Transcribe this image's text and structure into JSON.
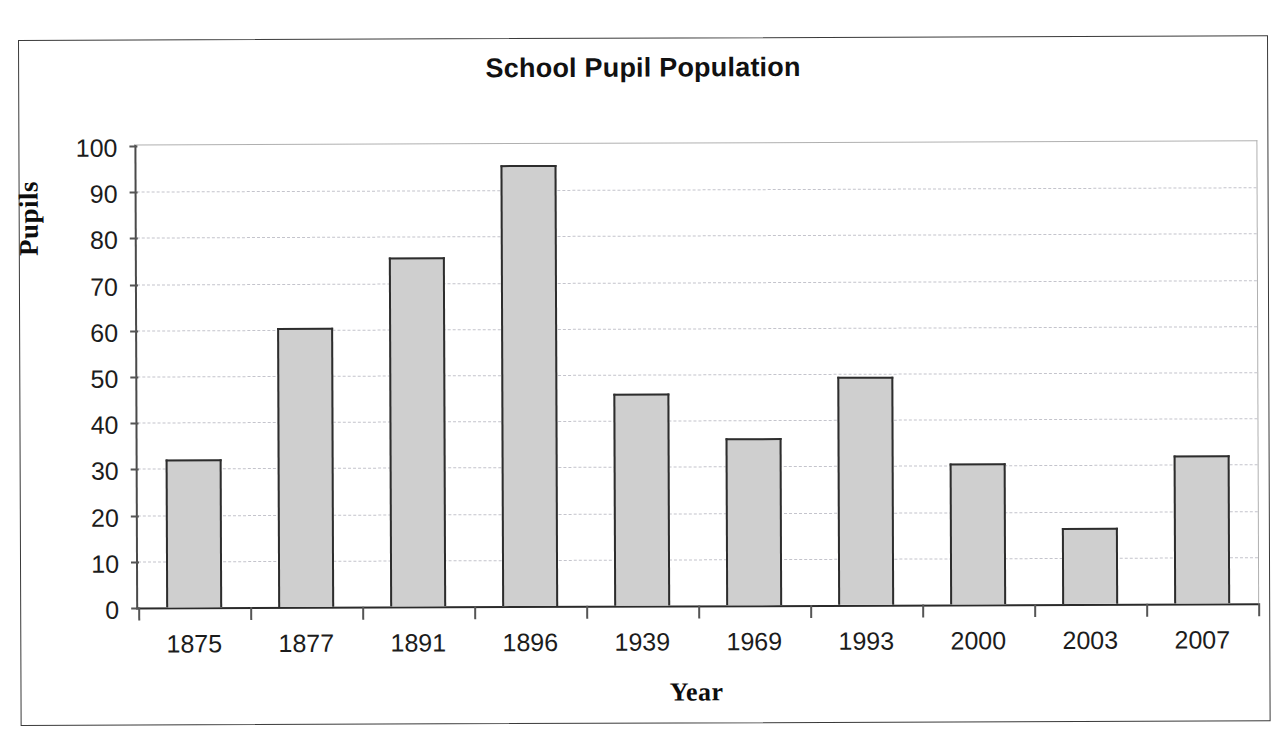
{
  "figure": {
    "title": "School Pupil Population"
  },
  "scan": {
    "top_artifact": "",
    "bottom_artifact": ""
  },
  "chart_data": {
    "type": "bar",
    "title": "School Pupil Population",
    "xlabel": "Year",
    "ylabel": "Pupils",
    "categories": [
      "1875",
      "1877",
      "1891",
      "1896",
      "1939",
      "1969",
      "1993",
      "2000",
      "2003",
      "2007"
    ],
    "values": [
      32,
      60.5,
      75.5,
      95.5,
      45.8,
      36.2,
      49.3,
      30.5,
      16.5,
      32
    ],
    "ylim": [
      0,
      100
    ],
    "ytick_labels": [
      "100",
      "90",
      "80",
      "70",
      "60",
      "50",
      "40",
      "30",
      "20",
      "10",
      "0"
    ],
    "ytick_values": [
      100,
      90,
      80,
      70,
      60,
      50,
      40,
      30,
      20,
      10,
      0
    ],
    "ytick_step": 10,
    "grid": true,
    "grid_axis": "y",
    "grid_style": "dashed",
    "legend": false,
    "bar_fill_color": "#cfcfcf",
    "bar_border_color": "#2d2d2d",
    "gridline_color": "#c4c4cc",
    "axis_color": "#2b2b2b",
    "background_color": "#ffffff"
  }
}
